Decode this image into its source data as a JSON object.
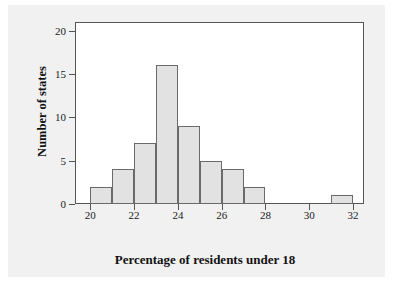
{
  "chart_data": {
    "type": "bar",
    "title": "",
    "subtitle": "",
    "xlabel": "Percentage of residents under 18",
    "ylabel": "Number of states",
    "xlim": [
      19.3,
      32.5
    ],
    "ylim": [
      0,
      21
    ],
    "xticks": [
      20,
      22,
      24,
      26,
      28,
      30,
      32
    ],
    "xtick_labels": [
      "20",
      "22",
      "24",
      "26",
      "28",
      "30",
      "32"
    ],
    "yticks": [
      0,
      5,
      10,
      15,
      20
    ],
    "ytick_labels": [
      "0",
      "5",
      "10",
      "15",
      "20"
    ],
    "grid": false,
    "legend": null,
    "bin_width": 1,
    "bins": [
      {
        "left": 20,
        "right": 21,
        "value": 2
      },
      {
        "left": 21,
        "right": 22,
        "value": 4
      },
      {
        "left": 22,
        "right": 23,
        "value": 7
      },
      {
        "left": 23,
        "right": 24,
        "value": 16
      },
      {
        "left": 24,
        "right": 25,
        "value": 9
      },
      {
        "left": 25,
        "right": 26,
        "value": 5
      },
      {
        "left": 26,
        "right": 27,
        "value": 4
      },
      {
        "left": 27,
        "right": 28,
        "value": 2
      },
      {
        "left": 28,
        "right": 29,
        "value": 0
      },
      {
        "left": 29,
        "right": 30,
        "value": 0
      },
      {
        "left": 30,
        "right": 31,
        "value": 0
      },
      {
        "left": 31,
        "right": 32,
        "value": 1
      }
    ],
    "categories": [
      "20-21",
      "21-22",
      "22-23",
      "23-24",
      "24-25",
      "25-26",
      "26-27",
      "27-28",
      "28-29",
      "29-30",
      "30-31",
      "31-32"
    ],
    "values": [
      2,
      4,
      7,
      16,
      9,
      5,
      4,
      2,
      0,
      0,
      0,
      1
    ],
    "total_observations": 50,
    "colors": {
      "bar_fill": "#e2e2e2",
      "bar_edge": "#6a6a6a",
      "axis": "#555555",
      "text": "#111111",
      "plot_bg": "#ffffff",
      "page_bg": "#f1f1f1"
    }
  }
}
